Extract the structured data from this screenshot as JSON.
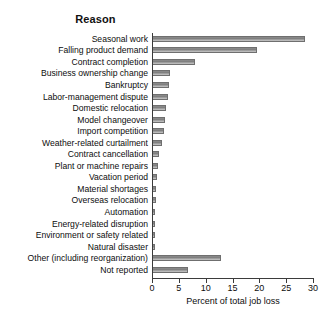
{
  "chart_data": {
    "type": "bar",
    "orientation": "horizontal",
    "title": "Reason",
    "xlabel": "Percent of total job loss",
    "ylabel": "",
    "xlim": [
      0,
      30
    ],
    "xticks": [
      0,
      5,
      10,
      15,
      20,
      25,
      30
    ],
    "grid": false,
    "legend": null,
    "bar_color": "#8a8a8a",
    "categories": [
      "Seasonal work",
      "Falling product demand",
      "Contract completion",
      "Business ownership change",
      "Bankruptcy",
      "Labor-management dispute",
      "Domestic relocation",
      "Model changeover",
      "Import competition",
      "Weather-related curtailment",
      "Contract cancellation",
      "Plant or machine repairs",
      "Vacation period",
      "Material shortages",
      "Overseas relocation",
      "Automation",
      "Energy-related disruption",
      "Environment or safety related",
      "Natural disaster",
      "Other (including reorganization)",
      "Not reported"
    ],
    "values": [
      28.5,
      19.6,
      8.0,
      3.3,
      3.1,
      3.0,
      2.6,
      2.4,
      2.2,
      1.9,
      1.3,
      1.1,
      0.9,
      0.8,
      0.7,
      0.6,
      0.5,
      0.4,
      0.3,
      12.8,
      6.7
    ]
  }
}
